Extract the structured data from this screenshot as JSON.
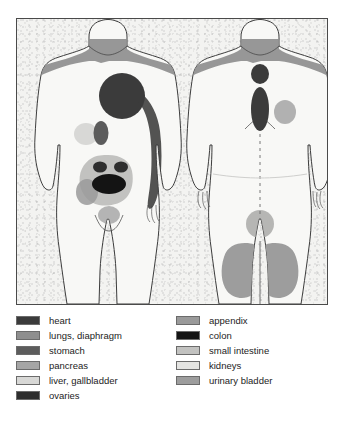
{
  "diagram": {
    "views": [
      {
        "name": "anterior-body-figure",
        "label": "front view"
      },
      {
        "name": "posterior-body-figure",
        "label": "back view"
      }
    ]
  },
  "colors": {
    "heart": "#3b3b3b",
    "lungs_diaphragm": "#8e8e8e",
    "stomach": "#5c5c5c",
    "pancreas": "#a5a5a5",
    "liver_gallbladder": "#d8d8d6",
    "ovaries": "#2e2e2e",
    "appendix": "#9a9a9a",
    "colon": "#141414",
    "small_intestine": "#c2c2c0",
    "kidneys": "#e4e4e2",
    "urinary_bladder": "#9d9d9d",
    "body_fill": "#f7f7f5",
    "body_outline": "#3d3d3d",
    "frame_border": "#4a4a4a",
    "paper": "#f2f2f0",
    "text": "#1c1c1c"
  },
  "legend": {
    "left_column": [
      {
        "label": "heart",
        "color_key": "heart",
        "swatch": "#3b3b3b"
      },
      {
        "label": "lungs, diaphragm",
        "color_key": "lungs_diaphragm",
        "swatch": "#8e8e8e"
      },
      {
        "label": "stomach",
        "color_key": "stomach",
        "swatch": "#5c5c5c"
      },
      {
        "label": "pancreas",
        "color_key": "pancreas",
        "swatch": "#a5a5a5"
      },
      {
        "label": "liver, gallbladder",
        "color_key": "liver_gallbladder",
        "swatch": "#d8d8d6"
      },
      {
        "label": "ovaries",
        "color_key": "ovaries",
        "swatch": "#2e2e2e"
      }
    ],
    "right_column": [
      {
        "label": "appendix",
        "color_key": "appendix",
        "swatch": "#9a9a9a"
      },
      {
        "label": "colon",
        "color_key": "colon",
        "swatch": "#141414"
      },
      {
        "label": "small intestine",
        "color_key": "small_intestine",
        "swatch": "#c2c2c0"
      },
      {
        "label": "kidneys",
        "color_key": "kidneys",
        "swatch": "#e4e4e2"
      },
      {
        "label": "urinary bladder",
        "color_key": "urinary_bladder",
        "swatch": "#9d9d9d"
      }
    ]
  },
  "regions": {
    "anterior": [
      {
        "organ": "lungs, diaphragm",
        "area": "neck and both shoulders"
      },
      {
        "organ": "heart",
        "area": "left upper chest and inner left arm"
      },
      {
        "organ": "stomach",
        "area": "epigastrium"
      },
      {
        "organ": "liver, gallbladder",
        "area": "right upper abdomen"
      },
      {
        "organ": "small intestine",
        "area": "periumbilical abdomen"
      },
      {
        "organ": "ovaries",
        "area": "both lower quadrants"
      },
      {
        "organ": "colon",
        "area": "lower mid abdomen"
      },
      {
        "organ": "appendix",
        "area": "right lower quadrant"
      },
      {
        "organ": "urinary bladder",
        "area": "suprapubic region"
      }
    ],
    "posterior": [
      {
        "organ": "lungs, diaphragm",
        "area": "upper back and shoulders"
      },
      {
        "organ": "heart",
        "area": "upper thoracic spine"
      },
      {
        "organ": "stomach",
        "area": "mid thoracic spine"
      },
      {
        "organ": "pancreas",
        "area": "left scapular region"
      },
      {
        "organ": "kidneys",
        "area": "lumbar region"
      },
      {
        "organ": "urinary bladder",
        "area": "both buttocks"
      }
    ]
  }
}
